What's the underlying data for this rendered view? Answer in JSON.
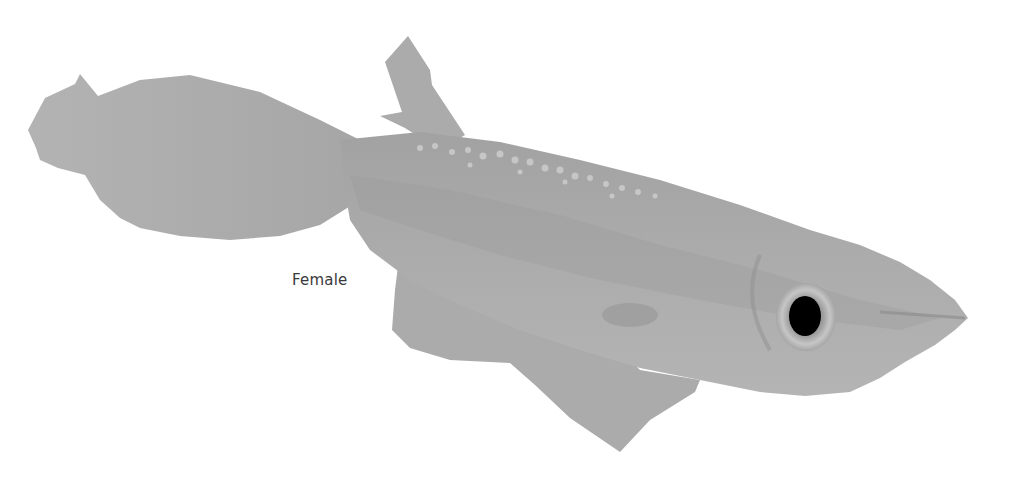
{
  "illustration": {
    "subject": "fish",
    "label": "Female",
    "colors": {
      "background": "#ffffff",
      "body": "#a9a9a9",
      "fin": "#b0b0b0",
      "shadow": "#8f8f8f",
      "highlight": "#c9c9c9",
      "eye": "#000000",
      "eye_ring": "#bdbdbd"
    }
  }
}
